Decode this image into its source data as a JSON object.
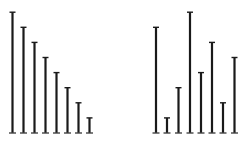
{
  "chart_data": [
    {
      "type": "bar",
      "title": "",
      "categories": [
        "1",
        "2",
        "3",
        "4",
        "5",
        "6",
        "7",
        "8"
      ],
      "values": [
        8,
        7,
        6,
        5,
        4,
        3,
        2,
        1
      ],
      "xlabel": "",
      "ylabel": "",
      "ylim": [
        0,
        8
      ],
      "style": "line-bars with serif caps",
      "description": "Sorted (descending) sequence"
    },
    {
      "type": "bar",
      "title": "",
      "categories": [
        "1",
        "2",
        "3",
        "4",
        "5",
        "6",
        "7",
        "8"
      ],
      "values": [
        7,
        1,
        3,
        8,
        4,
        6,
        2,
        5
      ],
      "xlabel": "",
      "ylabel": "",
      "ylim": [
        0,
        8
      ],
      "style": "line-bars with serif caps",
      "description": "Unsorted (shuffled) sequence"
    }
  ],
  "layout": {
    "baseline_y": 133,
    "unit_px": 15.1,
    "bar_color": "#1a1a1a",
    "groups": [
      {
        "x": [
          12.5,
          23.5,
          34.5,
          45.5,
          56.5,
          67.5,
          78.5,
          89.5
        ]
      },
      {
        "x": [
          156,
          167,
          178.5,
          190,
          201,
          212,
          223,
          234.5
        ]
      }
    ]
  }
}
